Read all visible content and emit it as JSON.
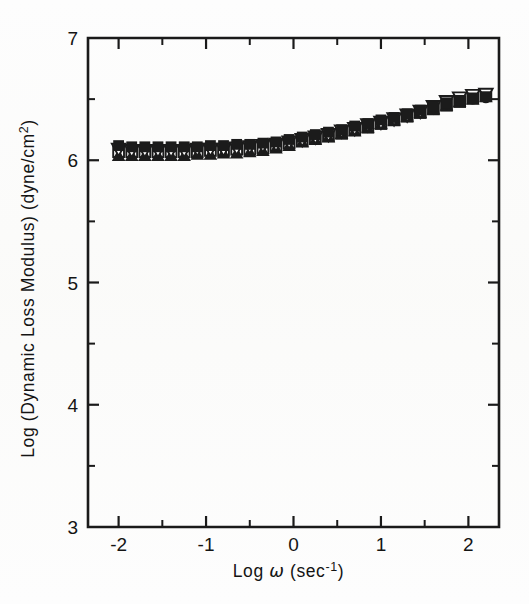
{
  "figure": {
    "background_color": "#fdfdfd",
    "ink_color": "#1b1b1b"
  },
  "chart_data": {
    "type": "scatter",
    "title": "",
    "xlabel_parts": {
      "log": "Log",
      "omega": "ω",
      "units_open": "(sec",
      "units_exp": "-1",
      "units_close": ")"
    },
    "xlabel": "Log ω (sec⁻¹)",
    "ylabel": "Log (Dynamic Loss Modulus) (dyne/cm²)",
    "ylabel_parts": {
      "main": "Log (Dynamic Loss Modulus) (dyne/cm",
      "exp": "2",
      "close": ")"
    },
    "xlim": [
      -2.35,
      2.35
    ],
    "ylim": [
      3,
      7
    ],
    "grid": false,
    "legend": "none",
    "x_ticks_major": [
      -2,
      -1,
      0,
      1,
      2
    ],
    "x_tick_labels": [
      "-2",
      "-1",
      "0",
      "1",
      "2"
    ],
    "x_ticks_minor": [
      -1.5,
      -0.5,
      0.5,
      1.5
    ],
    "y_ticks_major": [
      3,
      4,
      5,
      6,
      7
    ],
    "y_tick_labels": [
      "3",
      "4",
      "5",
      "6",
      "7"
    ],
    "y_ticks_minor": [
      3.5,
      4.5,
      5.5,
      6.5
    ],
    "tick_direction": "in",
    "series": [
      {
        "name": "series-1",
        "marker": "filled-circle",
        "x": [
          -2.0,
          -1.85,
          -1.7,
          -1.55,
          -1.4,
          -1.25,
          -1.1,
          -0.95,
          -0.8,
          -0.65,
          -0.5,
          -0.35,
          -0.2,
          -0.05,
          0.1,
          0.25,
          0.4,
          0.55,
          0.7,
          0.85,
          1.0,
          1.15,
          1.3,
          1.45,
          1.6,
          1.75,
          1.9,
          2.05,
          2.2
        ],
        "y": [
          6.11,
          6.1,
          6.1,
          6.1,
          6.1,
          6.1,
          6.1,
          6.11,
          6.11,
          6.12,
          6.12,
          6.13,
          6.14,
          6.16,
          6.18,
          6.2,
          6.22,
          6.24,
          6.27,
          6.29,
          6.32,
          6.34,
          6.37,
          6.4,
          6.43,
          6.45,
          6.48,
          6.5,
          6.51
        ]
      },
      {
        "name": "series-2",
        "marker": "open-square",
        "x": [
          -2.0,
          -1.85,
          -1.7,
          -1.55,
          -1.4,
          -1.25,
          -1.1,
          -0.95,
          -0.8,
          -0.65,
          -0.5,
          -0.35,
          -0.2,
          -0.05,
          0.1,
          0.25,
          0.4,
          0.55,
          0.7,
          0.85,
          1.0,
          1.15,
          1.3,
          1.45,
          1.6,
          1.75,
          1.9,
          2.05,
          2.2
        ],
        "y": [
          6.07,
          6.07,
          6.07,
          6.07,
          6.07,
          6.07,
          6.07,
          6.08,
          6.08,
          6.09,
          6.09,
          6.1,
          6.12,
          6.14,
          6.16,
          6.18,
          6.2,
          6.22,
          6.25,
          6.27,
          6.3,
          6.33,
          6.36,
          6.39,
          6.42,
          6.45,
          6.48,
          6.51,
          6.53
        ]
      },
      {
        "name": "series-3",
        "marker": "filled-tri-up",
        "x": [
          -2.0,
          -1.85,
          -1.7,
          -1.55,
          -1.4,
          -1.25,
          -1.1,
          -0.95,
          -0.8,
          -0.65,
          -0.5,
          -0.35,
          -0.2,
          -0.05,
          0.1,
          0.25,
          0.4,
          0.55,
          0.7,
          0.85,
          1.0,
          1.15,
          1.3,
          1.45,
          1.6,
          1.75,
          1.9,
          2.05,
          2.2
        ],
        "y": [
          6.04,
          6.04,
          6.04,
          6.04,
          6.04,
          6.04,
          6.05,
          6.05,
          6.06,
          6.06,
          6.07,
          6.08,
          6.1,
          6.12,
          6.15,
          6.17,
          6.19,
          6.22,
          6.24,
          6.27,
          6.3,
          6.33,
          6.36,
          6.39,
          6.42,
          6.45,
          6.48,
          6.5,
          6.52
        ]
      },
      {
        "name": "series-4",
        "marker": "open-tri-down",
        "x": [
          -2.0,
          -1.85,
          -1.7,
          -1.55,
          -1.4,
          -1.25,
          -1.1,
          -0.95,
          -0.8,
          -0.65,
          -0.5,
          -0.35,
          -0.2,
          -0.05,
          0.1,
          0.25,
          0.4,
          0.55,
          0.7,
          0.85,
          1.0,
          1.15,
          1.3,
          1.45,
          1.6,
          1.75,
          1.9,
          2.05,
          2.2
        ],
        "y": [
          6.09,
          6.08,
          6.08,
          6.08,
          6.08,
          6.08,
          6.09,
          6.09,
          6.09,
          6.1,
          6.11,
          6.12,
          6.13,
          6.15,
          6.17,
          6.19,
          6.21,
          6.24,
          6.26,
          6.29,
          6.31,
          6.34,
          6.37,
          6.4,
          6.44,
          6.48,
          6.51,
          6.53,
          6.54
        ]
      },
      {
        "name": "series-5",
        "marker": "filled-square",
        "x": [
          -2.0,
          -1.85,
          -1.7,
          -1.55,
          -1.4,
          -1.25,
          -1.1,
          -0.95,
          -0.8,
          -0.65,
          -0.5,
          -0.35,
          -0.2,
          -0.05,
          0.1,
          0.25,
          0.4,
          0.55,
          0.7,
          0.85,
          1.0,
          1.15,
          1.3,
          1.45,
          1.6,
          1.75,
          1.9,
          2.05,
          2.2
        ],
        "y": [
          6.12,
          6.11,
          6.11,
          6.11,
          6.11,
          6.11,
          6.11,
          6.12,
          6.12,
          6.13,
          6.13,
          6.14,
          6.15,
          6.17,
          6.19,
          6.21,
          6.23,
          6.25,
          6.28,
          6.3,
          6.33,
          6.35,
          6.38,
          6.41,
          6.44,
          6.47,
          6.49,
          6.51,
          6.52
        ]
      }
    ]
  }
}
